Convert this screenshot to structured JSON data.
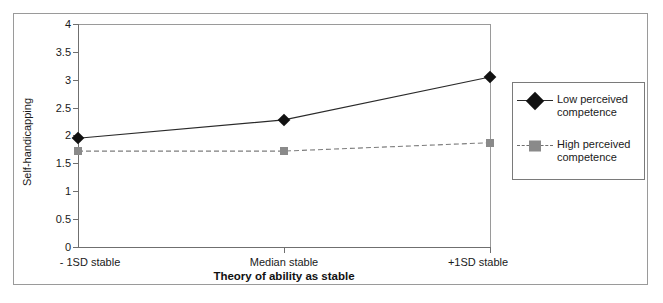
{
  "chart_data": {
    "type": "line",
    "title": "",
    "xlabel": "Theory of ability as stable",
    "ylabel": "Self-handicapping",
    "categories": [
      "- 1SD stable",
      "Median stable",
      "+1SD stable"
    ],
    "ylim": [
      0,
      4
    ],
    "yticks": [
      "0",
      "0.5",
      "1",
      "1.5",
      "2",
      "2.5",
      "3",
      "3.5",
      "4"
    ],
    "ytick_values": [
      0,
      0.5,
      1,
      1.5,
      2,
      2.5,
      3,
      3.5,
      4
    ],
    "grid": false,
    "legend_position": "right",
    "series": [
      {
        "name": "Low perceived competence",
        "values": [
          1.95,
          2.28,
          3.05
        ],
        "marker": "diamond",
        "color": "#111111",
        "linestyle": "solid"
      },
      {
        "name": "High perceived competence",
        "values": [
          1.72,
          1.72,
          1.87
        ],
        "marker": "square",
        "color": "#8a8a8a",
        "linestyle": "dashed"
      }
    ]
  },
  "legend": {
    "entries": [
      {
        "label": "Low perceived competence"
      },
      {
        "label": "High perceived competence"
      }
    ]
  },
  "colors": {
    "series_low": "#111111",
    "series_high": "#8a8a8a",
    "axis": "#6f6f6f",
    "frame": "#9a9a9a",
    "background": "#ffffff"
  }
}
